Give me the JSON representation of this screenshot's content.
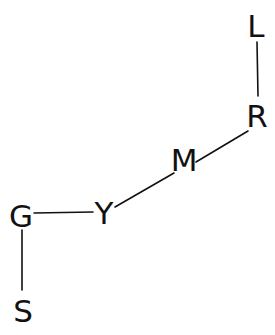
{
  "diagram": {
    "type": "graph",
    "nodes": [
      {
        "id": "L",
        "label": "L",
        "x": 256,
        "y": 26
      },
      {
        "id": "R",
        "label": "R",
        "x": 256,
        "y": 117
      },
      {
        "id": "M",
        "label": "M",
        "x": 184,
        "y": 160
      },
      {
        "id": "Y",
        "label": "Y",
        "x": 104,
        "y": 213
      },
      {
        "id": "G",
        "label": "G",
        "x": 21,
        "y": 216
      },
      {
        "id": "S",
        "label": "S",
        "x": 23,
        "y": 311
      }
    ],
    "edges": [
      {
        "from": "L",
        "to": "R",
        "x1": 257,
        "y1": 42,
        "x2": 258,
        "y2": 96
      },
      {
        "from": "R",
        "to": "M",
        "x1": 248,
        "y1": 131,
        "x2": 196,
        "y2": 162
      },
      {
        "from": "M",
        "to": "Y",
        "x1": 174,
        "y1": 173,
        "x2": 115,
        "y2": 207
      },
      {
        "from": "Y",
        "to": "G",
        "x1": 93,
        "y1": 212,
        "x2": 34,
        "y2": 213
      },
      {
        "from": "G",
        "to": "S",
        "x1": 22,
        "y1": 230,
        "x2": 22,
        "y2": 290
      }
    ]
  },
  "labels": {
    "L": "L",
    "R": "R",
    "M": "M",
    "Y": "Y",
    "G": "G",
    "S": "S"
  }
}
